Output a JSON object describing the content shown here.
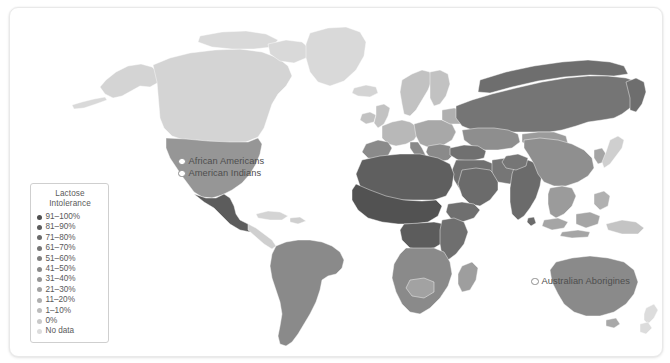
{
  "card": {
    "background": "#ffffff",
    "border_color": "#e9e9e9"
  },
  "legend": {
    "title_line1": "Lactose",
    "title_line2": "Intolerance",
    "items": [
      {
        "label": "91–100%",
        "color": "#4f4f4f"
      },
      {
        "label": "81–90%",
        "color": "#5c5c5c"
      },
      {
        "label": "71–80%",
        "color": "#6a6a6a"
      },
      {
        "label": "61–70%",
        "color": "#757575"
      },
      {
        "label": "51–60%",
        "color": "#7f7f7f"
      },
      {
        "label": "41–50%",
        "color": "#8a8a8a"
      },
      {
        "label": "31–40%",
        "color": "#969696"
      },
      {
        "label": "21–30%",
        "color": "#a2a2a2"
      },
      {
        "label": "11–20%",
        "color": "#afafaf"
      },
      {
        "label": "1–10%",
        "color": "#bcbcbc"
      },
      {
        "label": "0%",
        "color": "#c9c9c9"
      },
      {
        "label": "No data",
        "color": "#dcdcdc"
      }
    ]
  },
  "annotations": [
    {
      "id": "african-americans",
      "label": "African Americans"
    },
    {
      "id": "american-indians",
      "label": "American Indians"
    },
    {
      "id": "australian-aborigines",
      "label": "Australian Aborigines"
    }
  ],
  "chart_data": {
    "type": "map",
    "title": "Lactose Intolerance",
    "legend_position": "bottom-left",
    "value_unit": "percent",
    "no_data_color": "#dcdcdc",
    "color_scale": [
      {
        "bin": "0%",
        "color": "#c9c9c9"
      },
      {
        "bin": "1–10%",
        "color": "#bcbcbc"
      },
      {
        "bin": "11–20%",
        "color": "#afafaf"
      },
      {
        "bin": "21–30%",
        "color": "#a2a2a2"
      },
      {
        "bin": "31–40%",
        "color": "#969696"
      },
      {
        "bin": "41–50%",
        "color": "#8a8a8a"
      },
      {
        "bin": "51–60%",
        "color": "#7f7f7f"
      },
      {
        "bin": "61–70%",
        "color": "#757575"
      },
      {
        "bin": "71–80%",
        "color": "#6a6a6a"
      },
      {
        "bin": "81–90%",
        "color": "#5c5c5c"
      },
      {
        "bin": "91–100%",
        "color": "#4f4f4f"
      }
    ],
    "regions": [
      {
        "name": "Canada",
        "bin": "No data",
        "color": "#d4d4d4"
      },
      {
        "name": "Greenland",
        "bin": "No data",
        "color": "#d9d9d9"
      },
      {
        "name": "United States",
        "bin": "31–40%",
        "color": "#969696"
      },
      {
        "name": "Mexico",
        "bin": "81–90%",
        "color": "#5c5c5c"
      },
      {
        "name": "Central America",
        "bin": "No data",
        "color": "#d4d4d4"
      },
      {
        "name": "South America",
        "bin": "51–60%",
        "color": "#8a8a8a"
      },
      {
        "name": "Northern Europe",
        "bin": "1–10%",
        "color": "#c2c2c2"
      },
      {
        "name": "Western Europe",
        "bin": "11–20%",
        "color": "#b8b8b8"
      },
      {
        "name": "Southern Europe",
        "bin": "51–60%",
        "color": "#8a8a8a"
      },
      {
        "name": "Russia",
        "bin": "61–70%",
        "color": "#757575"
      },
      {
        "name": "North Africa",
        "bin": "81–90%",
        "color": "#5f5f5f"
      },
      {
        "name": "West Africa",
        "bin": "91–100%",
        "color": "#525252"
      },
      {
        "name": "Central Africa",
        "bin": "81–90%",
        "color": "#5c5c5c"
      },
      {
        "name": "East Africa",
        "bin": "71–80%",
        "color": "#6f6f6f"
      },
      {
        "name": "Southern Africa",
        "bin": "51–60%",
        "color": "#8a8a8a"
      },
      {
        "name": "Middle East",
        "bin": "71–80%",
        "color": "#707070"
      },
      {
        "name": "India",
        "bin": "61–70%",
        "color": "#6b6b6b"
      },
      {
        "name": "China",
        "bin": "81–90%",
        "color": "#8f8f8f"
      },
      {
        "name": "Southeast Asia",
        "bin": "91–100%",
        "color": "#9b9b9b"
      },
      {
        "name": "Japan",
        "bin": "No data",
        "color": "#cfcfcf"
      },
      {
        "name": "Australia",
        "bin": "41–50%",
        "color": "#8a8a8a"
      },
      {
        "name": "New Zealand",
        "bin": "No data",
        "color": "#dcdcdc"
      }
    ],
    "point_annotations": [
      {
        "label": "African Americans",
        "near": "United States"
      },
      {
        "label": "American Indians",
        "near": "United States"
      },
      {
        "label": "Australian Aborigines",
        "near": "Australia"
      }
    ]
  }
}
